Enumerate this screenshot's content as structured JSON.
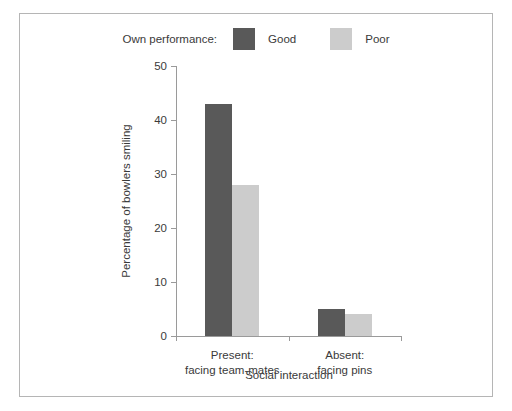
{
  "chart_data": {
    "type": "bar",
    "title": "",
    "subtitle": "",
    "xlabel": "Social interaction",
    "ylabel": "Percentage of bowlers smiling",
    "categories": [
      "Present:\nfacing team-mates",
      "Absent:\nfacing pins"
    ],
    "category_lines": [
      [
        "Present:",
        "facing team-mates"
      ],
      [
        "Absent:",
        "facing pins"
      ]
    ],
    "series": [
      {
        "name": "Good",
        "values": [
          43,
          5
        ],
        "color": "#595959"
      },
      {
        "name": "Poor",
        "values": [
          28,
          4
        ],
        "color": "#cccccc"
      }
    ],
    "ylim": [
      0,
      50
    ],
    "yticks": [
      0,
      10,
      20,
      30,
      40,
      50
    ],
    "ytick_labels": [
      "0",
      "10",
      "20",
      "30",
      "40",
      "50"
    ],
    "grid": false,
    "legend_position": "top-center",
    "legend_title": "Own performance:",
    "legend_entries": [
      {
        "label": "Good",
        "color": "#595959"
      },
      {
        "label": "Poor",
        "color": "#cccccc"
      }
    ],
    "axis_color": "#9a9a9a",
    "text_color": "#3a3a3a",
    "background": "#ffffff",
    "border_color": "#b5b5b5"
  }
}
